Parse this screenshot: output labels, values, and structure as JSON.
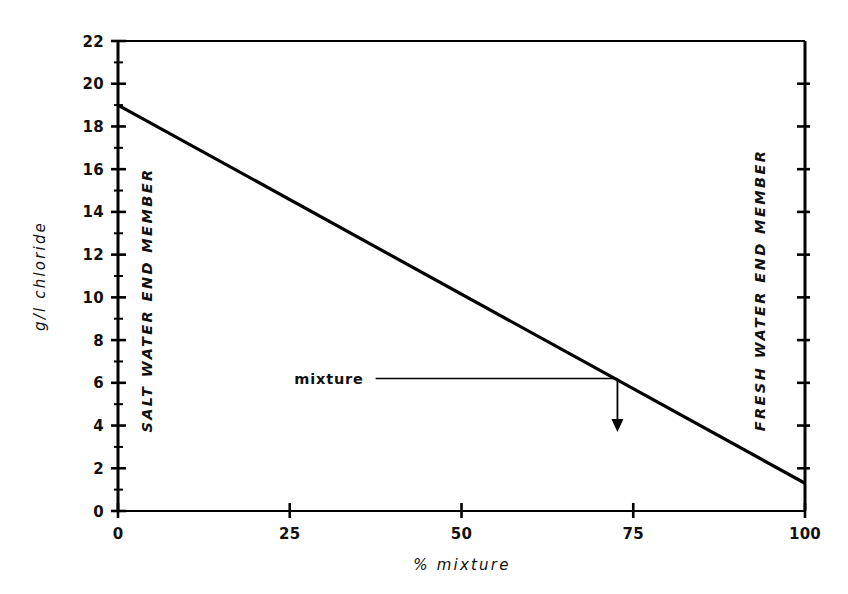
{
  "chart_data": {
    "type": "line",
    "title": "",
    "subtitle": "",
    "xlabel": "%  mixture",
    "ylabel": "g/l  chloride",
    "xlim": [
      0,
      100
    ],
    "ylim": [
      0,
      22
    ],
    "grid": false,
    "legend": null,
    "x_ticks": [
      0,
      25,
      50,
      75,
      100
    ],
    "x_tick_labels": [
      "0",
      "25",
      "50",
      "75",
      "100"
    ],
    "y_ticks": [
      0,
      2,
      4,
      6,
      8,
      10,
      12,
      14,
      16,
      18,
      20,
      22
    ],
    "y_tick_labels": [
      "0",
      "2",
      "4",
      "6",
      "8",
      "10",
      "12",
      "14",
      "16",
      "18",
      "20",
      "22"
    ],
    "y_minor_ticks": [
      1,
      3,
      5,
      7,
      9,
      11,
      13,
      15,
      17,
      19,
      21
    ],
    "series": [
      {
        "name": "mixing line",
        "x": [
          0,
          100
        ],
        "values": [
          19.0,
          1.3
        ],
        "color": "#000000",
        "linewidth": 3.2
      }
    ],
    "annotations": [
      {
        "name": "mixture",
        "label": "mixture",
        "x": 72.7,
        "y": 6.2,
        "leader_from_x": 37.5,
        "arrow_to_y": 3.7,
        "arrow_direction": "down"
      },
      {
        "name": "salt-water-end-member",
        "label": "SALT WATER END MEMBER",
        "orientation": "vertical-up",
        "x": 4.5
      },
      {
        "name": "fresh-water-end-member",
        "label": "FRESH WATER END MEMBER",
        "orientation": "vertical-up",
        "x": 93.5
      }
    ]
  },
  "figure": {
    "background_color": "#ffffff",
    "axis_color": "#000000",
    "line_color": "#000000"
  }
}
